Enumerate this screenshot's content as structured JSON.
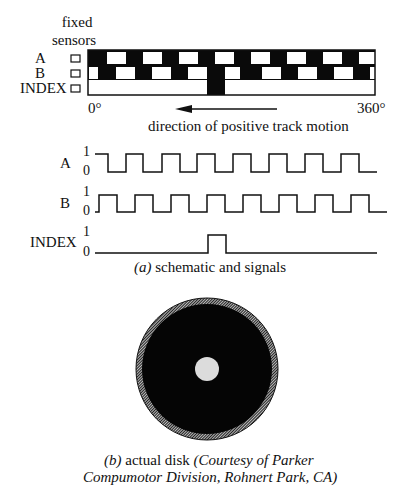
{
  "schematic": {
    "sensors_label_line1": "fixed",
    "sensors_label_line2": "sensors",
    "track_labels": [
      "A",
      "B",
      "INDEX"
    ],
    "angle_start": "0°",
    "angle_end": "360°",
    "direction_label": "direction  of positive track motion",
    "track": {
      "x": 88,
      "y": 50,
      "width": 287,
      "row_height": 15,
      "a_white_segments": [
        [
          107,
          126
        ],
        [
          143,
          162
        ],
        [
          179,
          198
        ],
        [
          215,
          234
        ],
        [
          251,
          270
        ],
        [
          287,
          306
        ],
        [
          323,
          342
        ],
        [
          359,
          375
        ]
      ],
      "b_white_segments": [
        [
          89,
          98
        ],
        [
          116,
          135
        ],
        [
          152,
          171
        ],
        [
          188,
          207
        ],
        [
          225,
          240
        ],
        [
          262,
          281
        ],
        [
          298,
          317
        ],
        [
          334,
          353
        ],
        [
          370,
          375
        ]
      ],
      "index_black_segment": [
        207,
        225
      ]
    }
  },
  "signals": {
    "levels": [
      "1",
      "0"
    ],
    "labels": [
      "A",
      "B",
      "INDEX"
    ],
    "A": {
      "start_x": 95,
      "end_x": 377,
      "start_level": 1,
      "edges": [
        108,
        126,
        143,
        162,
        180,
        197,
        215,
        233,
        251,
        269,
        287,
        305,
        323,
        341,
        359
      ]
    },
    "B": {
      "start_x": 95,
      "end_x": 387,
      "start_level": 0,
      "edges": [
        99,
        117,
        135,
        153,
        171,
        189,
        207,
        225,
        243,
        261,
        279,
        297,
        315,
        333,
        351,
        369
      ]
    },
    "INDEX": {
      "start_x": 95,
      "end_x": 377,
      "start_level": 0,
      "edges": [
        208,
        226
      ]
    }
  },
  "captions": {
    "a_label": "(a)",
    "a_text": " schematic and signals",
    "b_label": "(b)",
    "b_text": " actual disk ",
    "b_credit_line1": "(Courtesy of Parker",
    "b_credit_line2": "Compumotor Division, Rohnert Park, CA)"
  },
  "disk": {
    "cx": 207,
    "cy": 369,
    "r_outer": 71,
    "r_inner_black": 65,
    "r_hub": 12
  }
}
